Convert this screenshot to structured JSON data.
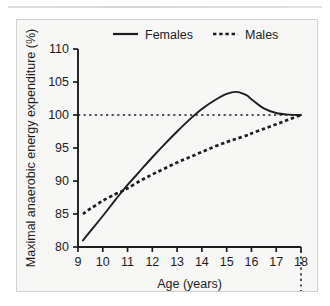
{
  "chart_data": {
    "type": "line",
    "title": "",
    "xlabel": "Age (years)",
    "ylabel": "Maximal anaerobic energy expenditure (%)",
    "xlim": [
      9,
      18
    ],
    "ylim": [
      80,
      110
    ],
    "xticks": [
      "9",
      "10",
      "11",
      "12",
      "13",
      "14",
      "15",
      "16",
      "17",
      "18"
    ],
    "yticks": [
      "80",
      "85",
      "90",
      "95",
      "100",
      "105",
      "110"
    ],
    "grid": false,
    "legend_position": "top",
    "legend": [
      {
        "name": "Females",
        "style": "solid"
      },
      {
        "name": "Males",
        "style": "dashed"
      }
    ],
    "reference_lines": [
      {
        "orientation": "horizontal",
        "value": 100,
        "style": "dotted"
      },
      {
        "orientation": "vertical",
        "value": 18,
        "style": "dotted"
      }
    ],
    "x": [
      9.2,
      9.5,
      10,
      10.5,
      10.8,
      11,
      11.5,
      12,
      12.5,
      13,
      13.5,
      14,
      14.5,
      15,
      15.4,
      15.8,
      16,
      16.5,
      17,
      17.5,
      18
    ],
    "series": [
      {
        "name": "Females",
        "style": "solid",
        "values": [
          81.0,
          82.4,
          84.7,
          87.1,
          88.5,
          89.4,
          91.5,
          93.6,
          95.6,
          97.5,
          99.3,
          100.9,
          102.2,
          103.2,
          103.5,
          103.0,
          102.4,
          101.0,
          100.3,
          100.05,
          100.0
        ]
      },
      {
        "name": "Males",
        "style": "dashed",
        "values": [
          85.0,
          85.8,
          87.0,
          88.0,
          88.5,
          88.9,
          90.0,
          91.0,
          91.9,
          92.8,
          93.6,
          94.4,
          95.2,
          95.9,
          96.4,
          96.9,
          97.2,
          97.9,
          98.6,
          99.3,
          100.0
        ]
      }
    ]
  },
  "colors": {
    "ink": "#1d1d1d",
    "panel_background": "#f7f7f6",
    "panel_border": "#d2d2d2",
    "page_background": "#ffffff"
  }
}
